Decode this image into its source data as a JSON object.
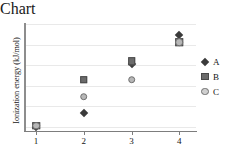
{
  "chart_data": {
    "type": "scatter",
    "title": "",
    "xlabel": "Ionization",
    "ylabel": "Ionization energy (kJ/mol)",
    "x": [
      1,
      2,
      3,
      4
    ],
    "xtick_labels": [
      "1",
      "2",
      "3",
      "4"
    ],
    "ytick_labels": [],
    "xlim": [
      0.75,
      4.35
    ],
    "ylim": [
      0,
      1
    ],
    "grid": "horizontal",
    "gridline_count": 6,
    "legend_position": "right",
    "series": [
      {
        "name": "A",
        "marker": "diamond",
        "color": "#3a3a3a",
        "values": [
          0.04,
          0.17,
          0.63,
          0.9
        ]
      },
      {
        "name": "B",
        "marker": "square",
        "color": "#6b6b6b",
        "values": [
          0.05,
          0.48,
          0.65,
          0.83
        ]
      },
      {
        "name": "C",
        "marker": "circle",
        "color": "#b7b7b7",
        "values": [
          0.05,
          0.32,
          0.48,
          0.83
        ]
      }
    ]
  },
  "legend": {
    "entries": [
      {
        "label": "A",
        "marker": "diamond"
      },
      {
        "label": "B",
        "marker": "square"
      },
      {
        "label": "C",
        "marker": "circle"
      }
    ]
  },
  "axes": {
    "x_title": "Ionization",
    "y_title": "Ionization energy (kJ/mol)"
  }
}
